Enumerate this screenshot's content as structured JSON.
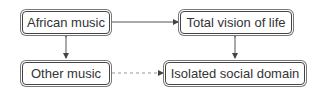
{
  "diagram": {
    "nodes": [
      {
        "id": "african",
        "label": "African music"
      },
      {
        "id": "total",
        "label": "Total vision of life"
      },
      {
        "id": "other",
        "label": "Other music"
      },
      {
        "id": "isolated",
        "label": "Isolated social domain"
      }
    ],
    "edges": [
      {
        "from": "african",
        "to": "total",
        "style": "solid",
        "direction": "forward"
      },
      {
        "from": "african",
        "to": "other",
        "style": "solid",
        "direction": "both"
      },
      {
        "from": "total",
        "to": "isolated",
        "style": "solid",
        "direction": "both"
      },
      {
        "from": "other",
        "to": "isolated",
        "style": "dashed",
        "direction": "forward"
      }
    ],
    "colors": {
      "border": "#444444",
      "line": "#555555",
      "dashed": "#999999",
      "text": "#333333"
    }
  }
}
